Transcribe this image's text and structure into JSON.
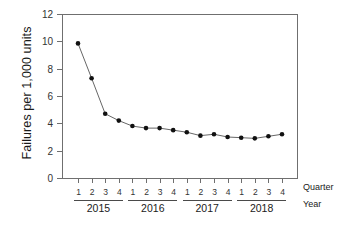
{
  "chart_data": {
    "type": "line",
    "title": "",
    "xlabel": "Year",
    "ylabel": "Failures per 1,000 units",
    "secondary_xlabel": "Quarter",
    "ylim": [
      0,
      12
    ],
    "yticks": [
      0,
      2,
      4,
      6,
      8,
      10,
      12
    ],
    "ytick_labels": [
      "0",
      "2",
      "4",
      "6",
      "8",
      "10",
      "12"
    ],
    "grid": false,
    "legend": "none",
    "marker": "filled-circle",
    "line_color": "#555555",
    "marker_color": "#111111",
    "x_groups": [
      {
        "label": "2015",
        "quarters": [
          "1",
          "2",
          "3",
          "4"
        ]
      },
      {
        "label": "2016",
        "quarters": [
          "1",
          "2",
          "3",
          "4"
        ]
      },
      {
        "label": "2017",
        "quarters": [
          "1",
          "2",
          "3",
          "4"
        ]
      },
      {
        "label": "2018",
        "quarters": [
          "1",
          "2",
          "3",
          "4"
        ]
      }
    ],
    "categories": [
      "2015 Q1",
      "2015 Q2",
      "2015 Q3",
      "2015 Q4",
      "2016 Q1",
      "2016 Q2",
      "2016 Q3",
      "2016 Q4",
      "2017 Q1",
      "2017 Q2",
      "2017 Q3",
      "2017 Q4",
      "2018 Q1",
      "2018 Q2",
      "2018 Q3",
      "2018 Q4"
    ],
    "values": [
      9.85,
      7.3,
      4.7,
      4.2,
      3.8,
      3.65,
      3.65,
      3.5,
      3.35,
      3.1,
      3.2,
      3.0,
      2.95,
      2.9,
      3.05,
      3.2
    ]
  },
  "axis": {
    "y_title": "Failures per 1,000 units",
    "quarter_label": "Quarter",
    "year_label": "Year"
  }
}
